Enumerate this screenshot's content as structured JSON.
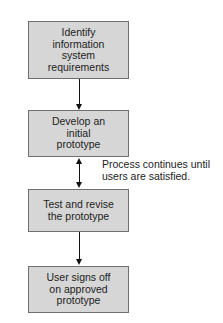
{
  "diagram": {
    "type": "flowchart",
    "title": "",
    "steps": [
      {
        "id": "step1",
        "label": "Identify information system requirements",
        "lines": [
          "Identify",
          "information",
          "system",
          "requirements"
        ]
      },
      {
        "id": "step2",
        "label": "Develop an initial prototype",
        "lines": [
          "Develop an",
          "initial",
          "prototype"
        ]
      },
      {
        "id": "step3",
        "label": "Test and revise the prototype",
        "lines": [
          "Test and revise",
          "the prototype"
        ]
      },
      {
        "id": "step4",
        "label": "User signs off on approved prototype",
        "lines": [
          "User signs off",
          "on approved",
          "prototype"
        ]
      }
    ],
    "connectors": [
      {
        "from": "step1",
        "to": "step2",
        "style": "single-arrow"
      },
      {
        "from": "step2",
        "to": "step3",
        "style": "double-arrow"
      },
      {
        "from": "step3",
        "to": "step4",
        "style": "single-arrow"
      }
    ],
    "annotation": {
      "attached_to": "step2-step3",
      "lines": [
        "Process continues until",
        "users are satisfied."
      ]
    },
    "colors": {
      "box_fill": "#d6d6d6",
      "box_border": "#6f6f6f",
      "text": "#222222",
      "arrow": "#111111"
    }
  }
}
